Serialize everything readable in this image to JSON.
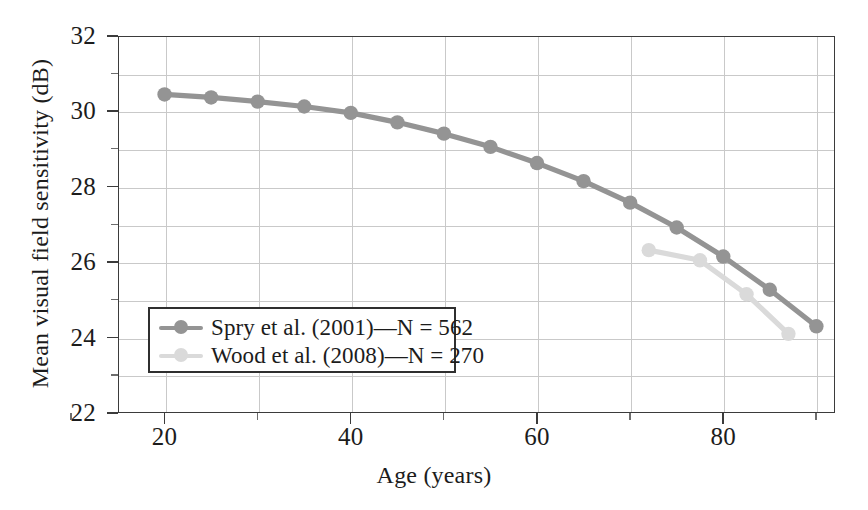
{
  "chart_data": {
    "type": "line",
    "title": "",
    "xlabel": "Age (years)",
    "ylabel": "Mean visual field sensitivity (dB)",
    "xlim": [
      15,
      92
    ],
    "ylim": [
      22,
      32
    ],
    "xticks": [
      20,
      40,
      60,
      80
    ],
    "xtick_labels": [
      "20",
      "40",
      "60",
      "80"
    ],
    "xticks_minor": [
      10,
      30,
      50,
      70,
      90
    ],
    "yticks": [
      22,
      24,
      26,
      28,
      30,
      32
    ],
    "ytick_labels": [
      "22",
      "24",
      "26",
      "28",
      "30",
      "32"
    ],
    "yticks_minor": [
      23,
      25,
      27,
      29,
      31
    ],
    "grid": true,
    "grid_x_values": [
      20,
      30,
      40,
      50,
      60,
      70,
      80,
      90
    ],
    "grid_y_values": [
      23,
      24,
      25,
      26,
      27,
      28,
      29,
      30,
      31
    ],
    "legend_position": "lower left",
    "series": [
      {
        "name": "Spry et al. (2001)—N = 562",
        "color": "#949494",
        "marker": "circle",
        "x": [
          20,
          25,
          30,
          35,
          40,
          45,
          50,
          55,
          60,
          65,
          70,
          75,
          80,
          85,
          90
        ],
        "y": [
          30.45,
          30.37,
          30.26,
          30.13,
          29.96,
          29.71,
          29.41,
          29.06,
          28.63,
          28.15,
          27.58,
          26.92,
          26.15,
          25.27,
          24.3
        ]
      },
      {
        "name": "Wood et al. (2008)—N = 270",
        "color": "#dadada",
        "marker": "circle",
        "x": [
          72,
          77.5,
          82.5,
          87
        ],
        "y": [
          26.32,
          26.05,
          25.15,
          24.1
        ]
      }
    ]
  },
  "legend": {
    "entries": [
      {
        "label": "Spry et al. (2001)—N = 562",
        "color": "#949494"
      },
      {
        "label": "Wood et al. (2008)—N = 270",
        "color": "#dadada"
      }
    ]
  },
  "axes": {
    "x_title": "Age (years)",
    "y_title": "Mean visual field sensitivity (dB)"
  },
  "colors": {
    "spry": "#949494",
    "wood": "#dadada",
    "frame": "#3b3b3b",
    "grid": "#c9c9c9",
    "text": "#1c1c1c"
  }
}
